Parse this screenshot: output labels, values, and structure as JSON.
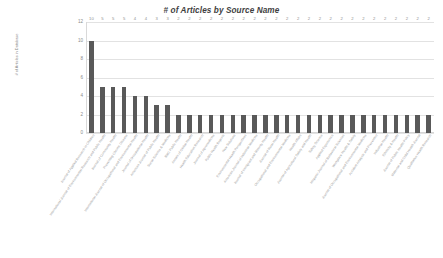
{
  "chart_data": {
    "type": "bar",
    "title": "# of Articles by Source Name",
    "xlabel": "",
    "ylabel": "# of Articles in Database",
    "ylim": [
      0,
      12
    ],
    "yticks": [
      0,
      2,
      4,
      6,
      8,
      10,
      12
    ],
    "grid": true,
    "legend": false,
    "bar_color": "#595959",
    "gridline_color": "#e2e2e2",
    "show_value_labels": true,
    "categories": [
      "Journal of Applied Research in Children",
      "International Journal of Environmental Research and Public Health",
      "Journal of Community Health",
      "Preventing Chronic Disease",
      "International Journal of Occupational and Environmental Health",
      "Journal of Occupational Health",
      "American Journal of Public Health",
      "Social Science & Medicine",
      "BMC Public Health",
      "Annals of Global Health",
      "Health Education Research",
      "Journal of Agromedicine",
      "Public Health Reports",
      "New Solutions",
      "Environmental Health Perspectives",
      "American Journal of Industrial Medicine",
      "Journal of Immigrant and Minority Health",
      "Journal of Rural Health",
      "Occupational and Environmental Medicine",
      "Health Affairs",
      "Journal of Agricultural Safety and Health",
      "Safety Science",
      "Applied Ergonomics",
      "Hispanic Journal of Behavioral Sciences",
      "Workplace Health & Safety",
      "Journal of Occupational and Environmental Medicine",
      "Accident Analysis and Prevention",
      "Industrial Health",
      "Ethnicity & Health",
      "Journal of Public Health Policy",
      "Maternal and Child Health Journal",
      "Qualitative Health Research"
    ],
    "values": [
      10,
      5,
      5,
      5,
      4,
      4,
      3,
      3,
      2,
      2,
      2,
      2,
      2,
      2,
      2,
      2,
      2,
      2,
      2,
      2,
      2,
      2,
      2,
      2,
      2,
      2,
      2,
      2,
      2,
      2,
      2,
      2
    ]
  }
}
